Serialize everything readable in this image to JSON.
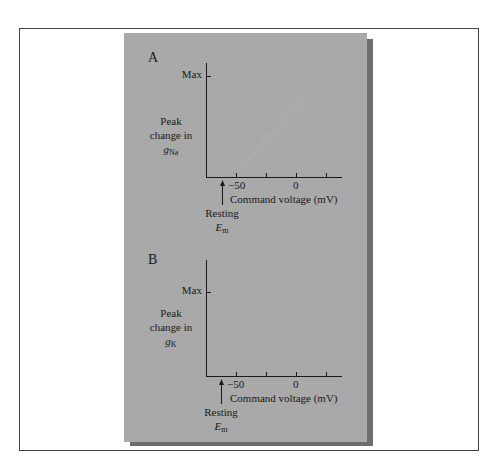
{
  "figure": {
    "panels": [
      {
        "label": "A",
        "y_max_label": "Max",
        "y_label_line1": "Peak",
        "y_label_line2": "change in",
        "y_label_var": "g",
        "y_label_sub": "Na",
        "x_tick_label_neg50": "−50",
        "x_tick_label_0": "0",
        "x_label": "Command voltage (mV)",
        "resting_label": "Resting",
        "resting_var": "E",
        "resting_sub": "m"
      },
      {
        "label": "B",
        "y_max_label": "Max",
        "y_label_line1": "Peak",
        "y_label_line2": "change in",
        "y_label_var": "g",
        "y_label_sub": "K",
        "x_tick_label_neg50": "−50",
        "x_tick_label_0": "0",
        "x_label": "Command voltage (mV)",
        "resting_label": "Resting",
        "resting_var": "E",
        "resting_sub": "m"
      }
    ],
    "colors": {
      "panel_bg": "#a9a9a9",
      "shadow": "#6e6e6e",
      "frame": "#444444",
      "axis": "#1a1a1a"
    }
  }
}
